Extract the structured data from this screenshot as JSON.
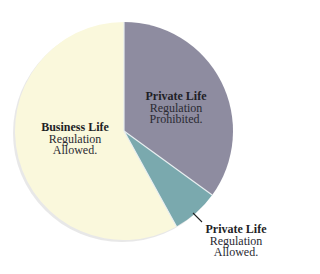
{
  "chart_data": {
    "type": "pie",
    "title": "",
    "start_angle_deg": 0,
    "direction": "clockwise",
    "slices": [
      {
        "name": "Private Life Regulation Prohibited.",
        "title": "Private Life",
        "line1": "Regulation",
        "line2": "Prohibited.",
        "value": 35,
        "color": "#8e8ca0"
      },
      {
        "name": "Private Life Regulation Allowed.",
        "title": "Private Life",
        "line1": "Regulation",
        "line2": "Allowed.",
        "value": 7,
        "color": "#7aa9ae"
      },
      {
        "name": "Business Life Regulation Allowed.",
        "title": "Business Life",
        "line1": "Regulation",
        "line2": "Allowed.",
        "value": 58,
        "color": "#faf8dc"
      }
    ],
    "legend": "none",
    "labels_position": "inside (Private Life Regulation Allowed label outside with leader line)"
  },
  "style": {
    "divider_color": "#e8eef0",
    "shadow_color": "#d6d6d6"
  }
}
